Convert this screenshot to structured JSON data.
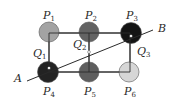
{
  "diagram": {
    "points": [
      {
        "name": "P",
        "sub": "1",
        "shade": "#a3a3a3"
      },
      {
        "name": "P",
        "sub": "2",
        "shade": "#636363"
      },
      {
        "name": "P",
        "sub": "3",
        "shade": "#141414"
      },
      {
        "name": "P",
        "sub": "4",
        "shade": "#232323"
      },
      {
        "name": "P",
        "sub": "5",
        "shade": "#5e5e5e"
      },
      {
        "name": "P",
        "sub": "6",
        "shade": "#d6d6d6"
      }
    ],
    "intersections": [
      {
        "name": "Q",
        "sub": "1"
      },
      {
        "name": "Q",
        "sub": "2"
      },
      {
        "name": "Q",
        "sub": "3"
      }
    ],
    "line_ends": {
      "start": "A",
      "end": "B"
    },
    "colors": {
      "line": "#2a2a2a",
      "stroke": "#555555"
    }
  }
}
